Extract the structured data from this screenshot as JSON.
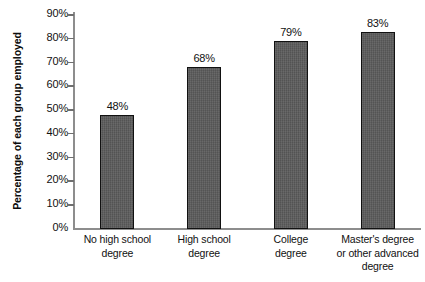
{
  "chart_data": {
    "type": "bar",
    "title": "",
    "subtitle": "",
    "xlabel": "",
    "ylabel": "Percentage of each group employed",
    "ylim": [
      0,
      90
    ],
    "ytick_step": 10,
    "grid": false,
    "legend": null,
    "legend_position": "none",
    "orientation": "vertical",
    "bar_color": "#5b5b5b",
    "bar_border_color": "#111111",
    "axis_color": "#8d8d8d",
    "categories": [
      "No high school degree",
      "High school degree",
      "College degree",
      "Master's degree or other advanced degree"
    ],
    "category_lines": [
      [
        "No high school",
        "degree"
      ],
      [
        "High school",
        "degree"
      ],
      [
        "College",
        "degree"
      ],
      [
        "Master's degree",
        "or other advanced",
        "degree"
      ]
    ],
    "values": [
      48,
      68,
      79,
      83
    ],
    "data_labels": [
      "48%",
      "68%",
      "79%",
      "83%"
    ],
    "ytick_labels": [
      "90%",
      "80%",
      "70%",
      "60%",
      "50%",
      "40%",
      "30%",
      "20%",
      "10%",
      "0%"
    ],
    "ytick_values": [
      90,
      80,
      70,
      60,
      50,
      40,
      30,
      20,
      10,
      0
    ]
  }
}
